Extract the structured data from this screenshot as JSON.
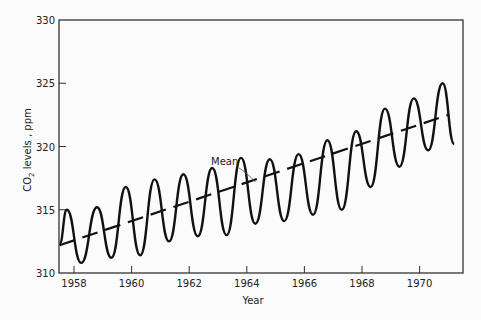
{
  "chart_data": {
    "type": "line",
    "title": "",
    "xlabel": "Year",
    "ylabel": "CO2 levels , ppm",
    "ylabel_parts": {
      "prefix": "CO",
      "subscript": "2",
      "suffix": " levels ,  ppm"
    },
    "xlim": [
      1957.5,
      1971.5
    ],
    "ylim": [
      310,
      330
    ],
    "x_ticks": [
      1958,
      1960,
      1962,
      1964,
      1966,
      1968,
      1970
    ],
    "x_tick_labels": [
      "1958",
      "1960",
      "1962",
      "1964",
      "1966",
      "1968",
      "1970"
    ],
    "y_ticks": [
      310,
      315,
      320,
      325,
      330
    ],
    "y_tick_labels": [
      "310",
      "315",
      "320",
      "325",
      "330"
    ],
    "grid": false,
    "legend": null,
    "annotations": [
      {
        "text": "Mean",
        "points_to_x": 1964.3,
        "points_to_y": 317.2
      }
    ],
    "series": [
      {
        "name": "Monthly CO2",
        "style": "solid",
        "x": [
          1957.5,
          1957.75,
          1958.25,
          1958.8,
          1959.3,
          1959.8,
          1960.3,
          1960.8,
          1961.3,
          1961.8,
          1962.3,
          1962.8,
          1963.3,
          1963.8,
          1964.3,
          1964.8,
          1965.3,
          1965.8,
          1966.3,
          1966.8,
          1967.3,
          1967.8,
          1968.3,
          1968.8,
          1969.3,
          1969.8,
          1970.3,
          1970.8,
          1971.2
        ],
        "y": [
          312.3,
          315.0,
          310.8,
          315.2,
          311.2,
          316.8,
          311.4,
          317.4,
          312.5,
          317.8,
          312.9,
          318.3,
          313.0,
          319.1,
          313.9,
          319.0,
          314.1,
          319.4,
          314.6,
          320.5,
          315.0,
          321.2,
          316.8,
          323.0,
          318.4,
          323.8,
          319.7,
          325.0,
          320.2
        ]
      },
      {
        "name": "Mean",
        "style": "dashed",
        "x": [
          1957.5,
          1971.0
        ],
        "y": [
          312.2,
          322.5
        ]
      }
    ]
  }
}
